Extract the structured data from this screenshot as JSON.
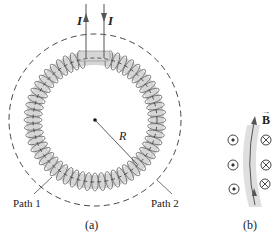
{
  "figure": {
    "panel_a": {
      "caption": "(a)",
      "current_label_left": "I",
      "current_label_right": "I",
      "radius_label": "R",
      "path1_label": "Path 1",
      "path2_label": "Path 2"
    },
    "panel_b": {
      "caption": "(b)",
      "field_label": "B",
      "field_arrow": "→",
      "out_of_page_symbol": "dot-in-circle",
      "into_page_symbol": "cross-in-circle"
    },
    "colors": {
      "line": "#333333",
      "coil_fill": "#d6d6d6",
      "coil_stroke": "#6a6a6a",
      "background": "#ffffff"
    }
  }
}
